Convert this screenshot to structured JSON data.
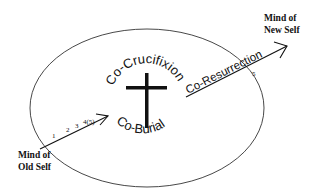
{
  "diagram": {
    "center_ring": {
      "top_label": "Co-Crucifixion",
      "bottom_label": "Co-Burial",
      "symbol": "cross-icon"
    },
    "start_node": {
      "line1": "Mind of",
      "line2": "Old Self"
    },
    "end_node": {
      "line1": "Mind of",
      "line2": "New Self"
    },
    "entry_arrow": {
      "step_labels": [
        "1",
        "2",
        "3",
        "4(5)"
      ]
    },
    "exit_arrow": {
      "label": "Co-Resurrection",
      "step_label": "5"
    },
    "colors": {
      "stroke": "#1a1a1a",
      "background": "#ffffff"
    }
  }
}
